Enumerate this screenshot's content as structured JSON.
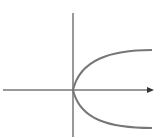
{
  "diagram": {
    "equation_shape": "x = k*y^2",
    "colors": {
      "axis": "#333333",
      "curve": "#777777",
      "background": "#ffffff"
    },
    "axes": {
      "x_axis": {
        "arrow": true
      },
      "y_axis": {
        "arrow": false
      }
    },
    "curve": {
      "type": "parabola",
      "opens": "right",
      "vertex": "origin"
    }
  }
}
